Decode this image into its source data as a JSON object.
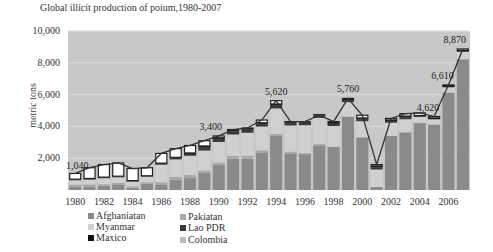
{
  "chart_data": {
    "type": "bar",
    "stacked": true,
    "title": "Global illicit production of poium,1980-2007",
    "xlabel": "",
    "ylabel": "metric tons",
    "ylim": [
      0,
      10000
    ],
    "yticks": [
      "2,000",
      "4,000",
      "6,000",
      "8,000",
      "10,000"
    ],
    "yticks_labeled": [
      2000,
      4000,
      6000,
      8000,
      10000
    ],
    "ylabel_visible_ticks": [
      "10,000",
      "8,000",
      "6,000",
      "4,000",
      "2,000"
    ],
    "xtick_labels": [
      "1980",
      "1982",
      "1984",
      "1986",
      "1988",
      "1990",
      "1992",
      "1994",
      "1996",
      "1998",
      "2000",
      "2002",
      "2004",
      "2006"
    ],
    "categories": [
      1980,
      1981,
      1982,
      1983,
      1984,
      1985,
      1986,
      1987,
      1988,
      1989,
      1990,
      1991,
      1992,
      1993,
      1994,
      1995,
      1996,
      1997,
      1998,
      1999,
      2000,
      2001,
      2002,
      2003,
      2004,
      2005,
      2006,
      2007
    ],
    "totals": [
      1040,
      1400,
      1600,
      1700,
      1350,
      1400,
      2300,
      2600,
      2800,
      3100,
      3400,
      3800,
      3900,
      4400,
      5620,
      4300,
      4300,
      4700,
      4300,
      5760,
      4700,
      1600,
      4500,
      4800,
      4850,
      4620,
      6610,
      8870
    ],
    "series": [
      {
        "name": "Afghaniatan",
        "color": "#8a8a8a",
        "values": [
          200,
          225,
          275,
          350,
          140,
          400,
          350,
          625,
          750,
          1100,
          1570,
          1980,
          1970,
          2330,
          3400,
          2300,
          2250,
          2800,
          2700,
          4600,
          3300,
          185,
          3400,
          3600,
          4200,
          4100,
          6100,
          8200
        ]
      },
      {
        "name": "Pakiatan",
        "color": "#a8a8a8",
        "values": [
          150,
          130,
          90,
          100,
          90,
          90,
          140,
          200,
          200,
          130,
          150,
          160,
          180,
          160,
          130,
          110,
          75,
          85,
          25,
          25,
          25,
          5,
          5,
          50,
          40,
          35,
          40,
          45
        ]
      },
      {
        "name": "Myanmar",
        "color": "#d0d0d0",
        "values": [
          260,
          300,
          375,
          350,
          300,
          350,
          1100,
          1100,
          1200,
          1250,
          1300,
          1350,
          1450,
          1500,
          1600,
          1650,
          1750,
          1650,
          1300,
          900,
          1000,
          1100,
          830,
          800,
          350,
          310,
          320,
          450
        ]
      },
      {
        "name": "Lao PDR",
        "color": "#3a3a3a",
        "values": [
          50,
          50,
          50,
          50,
          40,
          35,
          75,
          100,
          120,
          220,
          200,
          200,
          230,
          180,
          200,
          180,
          200,
          200,
          140,
          120,
          170,
          130,
          110,
          120,
          45,
          15,
          20,
          10
        ]
      },
      {
        "name": "Maxico",
        "color": "#111111",
        "values": [
          20,
          20,
          20,
          20,
          20,
          20,
          25,
          30,
          60,
          70,
          70,
          60,
          40,
          60,
          80,
          50,
          50,
          50,
          60,
          40,
          40,
          90,
          60,
          80,
          50,
          70,
          70,
          70
        ]
      },
      {
        "name": "Colombia",
        "color": "#bdbdbd",
        "values": [
          0,
          0,
          0,
          0,
          0,
          0,
          0,
          0,
          0,
          0,
          0,
          0,
          0,
          0,
          0,
          0,
          0,
          0,
          0,
          0,
          0,
          0,
          0,
          0,
          0,
          0,
          0,
          0
        ]
      },
      {
        "name": "Rest of world",
        "color": "#ffffff",
        "values": [
          360,
          675,
          790,
          830,
          760,
          505,
          610,
          545,
          470,
          330,
          110,
          50,
          30,
          170,
          210,
          10,
          -25,
          -85,
          75,
          75,
          165,
          90,
          95,
          150,
          165,
          90,
          60,
          95
        ]
      }
    ],
    "annotations": [
      {
        "year": 1980,
        "text": "1,040"
      },
      {
        "year": 1990,
        "text": "3,400"
      },
      {
        "year": 1994,
        "text": "5,620"
      },
      {
        "year": 1999,
        "text": "5,760"
      },
      {
        "year": 2005,
        "text": "4,620"
      },
      {
        "year": 2006,
        "text": "6,610"
      },
      {
        "year": 2007,
        "text": "8,870"
      }
    ],
    "grid": true,
    "legend_position": "bottom-left"
  },
  "title": "Global illicit production of poium,1980-2007",
  "ylabel": "metric tons",
  "legend": [
    {
      "label": "Afghaniatan",
      "color": "#8a8a8a"
    },
    {
      "label": "Myanmar",
      "color": "#d0d0d0"
    },
    {
      "label": "Maxico",
      "color": "#111111"
    },
    {
      "label": "Pakiatan",
      "color": "#a8a8a8"
    },
    {
      "label": "Lao PDR",
      "color": "#3a3a3a"
    },
    {
      "label": "Colombia",
      "color": "#bdbdbd"
    }
  ]
}
